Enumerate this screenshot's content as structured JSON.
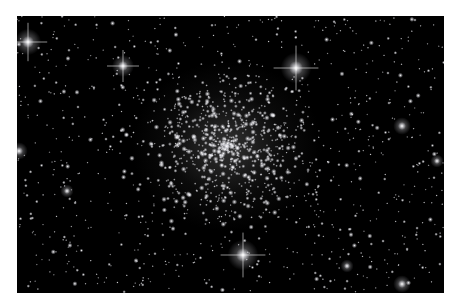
{
  "image": {
    "subject": "Globular star cluster in a dense starfield",
    "background_color": "#000000",
    "border_color": "#ffffff",
    "frame": {
      "x": 17,
      "y": 16,
      "width": 427,
      "height": 277
    },
    "cluster_center": {
      "x": 210,
      "y": 130
    },
    "cluster_radius": 90,
    "bright_stars": [
      {
        "x": 279,
        "y": 52,
        "size": 7,
        "spikes": true
      },
      {
        "x": 226,
        "y": 239,
        "size": 7,
        "spikes": true
      },
      {
        "x": 11,
        "y": 26,
        "size": 6,
        "spikes": true
      },
      {
        "x": 106,
        "y": 50,
        "size": 5,
        "spikes": true
      },
      {
        "x": 2,
        "y": 135,
        "size": 4,
        "spikes": false
      },
      {
        "x": 385,
        "y": 110,
        "size": 4,
        "spikes": false
      },
      {
        "x": 50,
        "y": 175,
        "size": 3,
        "spikes": false
      },
      {
        "x": 420,
        "y": 145,
        "size": 3,
        "spikes": false
      },
      {
        "x": 330,
        "y": 250,
        "size": 3,
        "spikes": false
      },
      {
        "x": 385,
        "y": 268,
        "size": 4,
        "spikes": false
      }
    ],
    "field_star_count": 900,
    "cluster_star_count": 700
  }
}
